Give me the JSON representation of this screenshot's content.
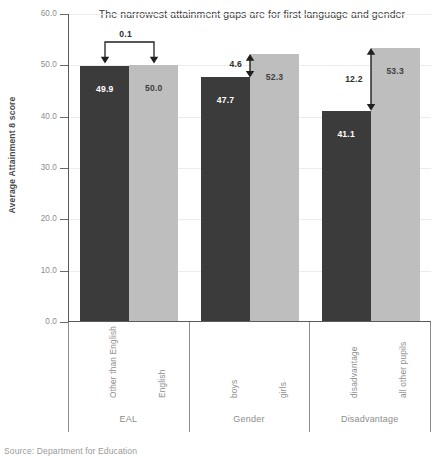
{
  "chart_data": {
    "type": "bar",
    "title": "The narrowest attainment gaps are for first language and gender",
    "xlabel": "",
    "ylabel": "Average Attainment 8 score",
    "ylim": [
      0.0,
      60.0
    ],
    "ytick_labels": [
      "0.0",
      "10.0",
      "20.0",
      "30.0",
      "40.0",
      "50.0",
      "60.0"
    ],
    "ytick_values": [
      0,
      10,
      20,
      30,
      40,
      50,
      60
    ],
    "grid": true,
    "legend": "none",
    "categories": [
      "EAL",
      "Gender",
      "Disadvantage"
    ],
    "bars": [
      {
        "group": "EAL",
        "label": "Other than English",
        "value": 49.9,
        "value_text": "49.9",
        "shade": "dark"
      },
      {
        "group": "EAL",
        "label": "English",
        "value": 50.0,
        "value_text": "50.0",
        "shade": "light"
      },
      {
        "group": "Gender",
        "label": "boys",
        "value": 47.7,
        "value_text": "47.7",
        "shade": "dark"
      },
      {
        "group": "Gender",
        "label": "girls",
        "value": 52.3,
        "value_text": "52.3",
        "shade": "light"
      },
      {
        "group": "Disadvantage",
        "label": "disadvantage",
        "value": 41.1,
        "value_text": "41.1",
        "shade": "dark"
      },
      {
        "group": "Disadvantage",
        "label": "all other pupils",
        "value": 53.3,
        "value_text": "53.3",
        "shade": "light"
      }
    ],
    "annotations": [
      {
        "group": "EAL",
        "gap": 0.1,
        "text": "0.1",
        "style": "bracket-down"
      },
      {
        "group": "Gender",
        "gap": 4.6,
        "text": "4.6",
        "style": "double-arrow"
      },
      {
        "group": "Disadvantage",
        "gap": 12.2,
        "text": "12.2",
        "style": "double-arrow"
      }
    ],
    "source": "Source: Department for Education"
  },
  "colors": {
    "bar_dark": "#3b3b3b",
    "bar_light": "#bebebe",
    "axis": "#5a5a5a",
    "grid": "#ececec",
    "tick_text": "#8d8d8d",
    "title_text": "#3c3c3c"
  }
}
